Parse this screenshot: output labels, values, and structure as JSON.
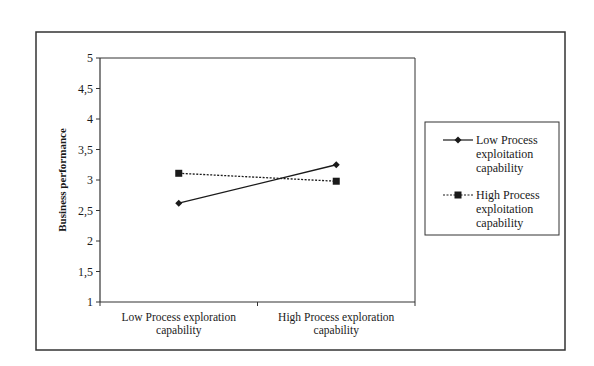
{
  "chart_data": {
    "type": "line",
    "title": "",
    "xlabel": "",
    "ylabel": "Business performance",
    "ylim": [
      1,
      5
    ],
    "yticks": [
      "1",
      "1,5",
      "2",
      "2,5",
      "3",
      "3,5",
      "4",
      "4,5",
      "5"
    ],
    "categories": [
      "Low Process exploration capability",
      "High Process exploration capability"
    ],
    "category_lines": [
      [
        "Low Process exploration",
        "capability"
      ],
      [
        "High Process exploration",
        "capability"
      ]
    ],
    "series": [
      {
        "name": "Low Process exploitation capability",
        "legend_lines": [
          "Low Process",
          "exploitation",
          "capability"
        ],
        "values": [
          2.62,
          3.25
        ],
        "marker": "diamond",
        "line": "solid"
      },
      {
        "name": "High Process exploitation capability",
        "legend_lines": [
          "High Process",
          "exploitation",
          "capability"
        ],
        "values": [
          3.11,
          2.98
        ],
        "marker": "square",
        "line": "dotted"
      }
    ],
    "grid": false,
    "legend_position": "right"
  },
  "colors": {
    "line": "#1a1a1a",
    "frame": "#333333",
    "background": "#ffffff"
  }
}
